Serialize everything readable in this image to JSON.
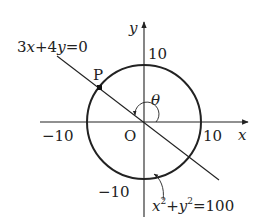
{
  "diagram": {
    "type": "coordinate-plane",
    "axes": {
      "x_label": "x",
      "y_label": "y",
      "origin_label": "O"
    },
    "ticks": {
      "x_positive": "10",
      "x_negative": "−10",
      "y_positive": "10",
      "y_negative": "−10"
    },
    "circle": {
      "equation_parts": {
        "x": "x",
        "exp1": "2",
        "plus": "+",
        "y": "y",
        "exp2": "2",
        "eq": "=100"
      },
      "radius": 10
    },
    "line": {
      "equation": "3x+4y=0",
      "parts": {
        "a": "3",
        "x": "x",
        "mid": "+4",
        "y": "y",
        "rhs": "=0"
      }
    },
    "point": {
      "label": "P"
    },
    "angle": {
      "label": "θ"
    },
    "colors": {
      "stroke": "#222222",
      "background": "#ffffff"
    }
  }
}
